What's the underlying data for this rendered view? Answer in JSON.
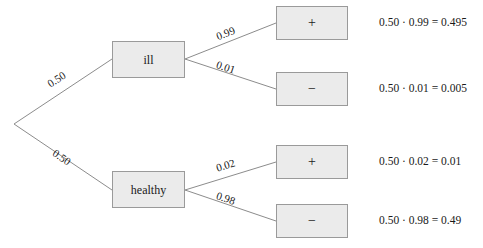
{
  "diagram": {
    "type": "probability-tree",
    "root": {
      "label": ""
    },
    "stage1": {
      "branches": [
        {
          "label": "ill",
          "probability": "0.50"
        },
        {
          "label": "healthy",
          "probability": "0.50"
        }
      ]
    },
    "stage2": {
      "ill": [
        {
          "label": "+",
          "probability": "0.99"
        },
        {
          "label": "−",
          "probability": "0.01"
        }
      ],
      "healthy": [
        {
          "label": "+",
          "probability": "0.02"
        },
        {
          "label": "−",
          "probability": "0.98"
        }
      ]
    },
    "results": [
      {
        "text": "0.50 · 0.99 = 0.495"
      },
      {
        "text": "0.50 · 0.01 = 0.005"
      },
      {
        "text": "0.50 · 0.02 = 0.01"
      },
      {
        "text": "0.50 · 0.98 = 0.49"
      }
    ],
    "colors": {
      "box_fill": "#ebebeb",
      "box_border": "#9a9a9a",
      "edge": "#8c8c8c",
      "text": "#1a1a1a",
      "background": "#ffffff"
    }
  }
}
